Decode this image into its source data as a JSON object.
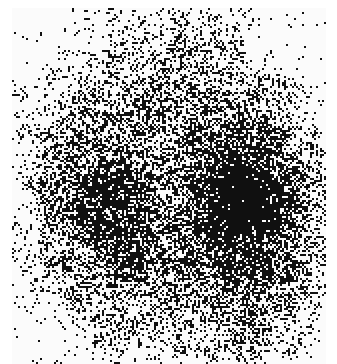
{
  "image": {
    "kind": "halftone-dithered-grayscale-noise",
    "description": "Scanned noisy dithered bitmap showing two dark blobs on a lighter speckled field",
    "width_px": 337,
    "height_px": 364,
    "background_color": "#ffffff",
    "ink_color": "#101010",
    "paper_color": "#fbfbfb",
    "content_area": {
      "x": 12,
      "y": 8,
      "width": 314,
      "height": 356
    },
    "dither": {
      "cell_px": 2,
      "pattern": "random-threshold / error-diffusion speckle",
      "global_density": 0.47
    },
    "density_field": {
      "base_density": 0.3,
      "edge_falloff": 0.22,
      "blobs": [
        {
          "name": "left-blob",
          "cx": 95,
          "cy": 205,
          "rx": 78,
          "ry": 92,
          "amplitude": 0.34
        },
        {
          "name": "right-blob",
          "cx": 245,
          "cy": 205,
          "rx": 80,
          "ry": 100,
          "amplitude": 0.52
        },
        {
          "name": "right-blob-core",
          "cx": 252,
          "cy": 200,
          "rx": 50,
          "ry": 62,
          "amplitude": 0.3
        },
        {
          "name": "left-blob-core",
          "cx": 100,
          "cy": 215,
          "rx": 40,
          "ry": 48,
          "amplitude": 0.2
        },
        {
          "name": "lower-left-spot",
          "cx": 128,
          "cy": 262,
          "rx": 30,
          "ry": 22,
          "amplitude": 0.26
        },
        {
          "name": "upper-center-haze",
          "cx": 180,
          "cy": 70,
          "rx": 95,
          "ry": 55,
          "amplitude": 0.14
        },
        {
          "name": "lower-right-tail",
          "cx": 270,
          "cy": 300,
          "rx": 60,
          "ry": 52,
          "amplitude": 0.2
        },
        {
          "name": "bottom-center-band",
          "cx": 175,
          "cy": 330,
          "rx": 110,
          "ry": 38,
          "amplitude": 0.12
        }
      ],
      "light_regions": [
        {
          "name": "top-left-corner",
          "cx": 30,
          "cy": 25,
          "rx": 55,
          "ry": 45,
          "amplitude": 0.22
        },
        {
          "name": "top-right-corner",
          "cx": 305,
          "cy": 30,
          "rx": 55,
          "ry": 50,
          "amplitude": 0.24
        },
        {
          "name": "bottom-left-corner",
          "cx": 30,
          "cy": 340,
          "rx": 50,
          "ry": 45,
          "amplitude": 0.18
        },
        {
          "name": "mid-left-edge",
          "cx": 16,
          "cy": 185,
          "rx": 34,
          "ry": 70,
          "amplitude": 0.14
        },
        {
          "name": "center-gap",
          "cx": 172,
          "cy": 198,
          "rx": 26,
          "ry": 60,
          "amplitude": 0.1
        }
      ]
    },
    "seed": 20240517
  }
}
